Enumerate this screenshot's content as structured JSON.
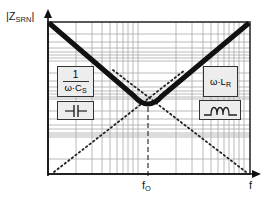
{
  "diagram": {
    "y_axis": {
      "label_main": "|Z",
      "label_sub": "SRN",
      "label_end": "|",
      "scale": "log"
    },
    "x_axis": {
      "label": "f",
      "scale": "log",
      "marker": {
        "main": "f",
        "sub": "O"
      }
    },
    "curves": [
      {
        "name": "total-impedance",
        "style": "thick-solid",
        "shape": "V with minimum at f0"
      },
      {
        "name": "capacitive-asymptote",
        "style": "dotted",
        "slope": "falling"
      },
      {
        "name": "inductive-asymptote",
        "style": "dotted",
        "slope": "rising"
      }
    ],
    "annotations": {
      "capacitor_formula": {
        "numerator": "1",
        "denominator_main": "ω·C",
        "denominator_sub": "S"
      },
      "capacitor_symbol": "capacitor-symbol",
      "inductor_formula": {
        "main": "ω·L",
        "sub": "R"
      },
      "inductor_symbol": "inductor-symbol"
    },
    "colors": {
      "curve": "#111111",
      "grid": "#a8a8a8",
      "frame": "#222222",
      "box_fill": "#ededed"
    }
  }
}
